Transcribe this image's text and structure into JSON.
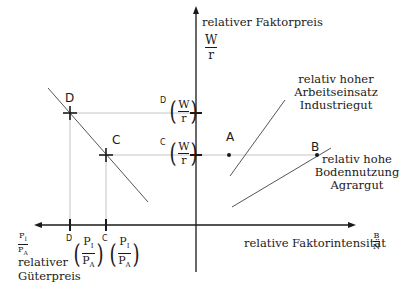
{
  "y_axis": {
    "label": "relativer Faktorpreis",
    "fraction": {
      "num": "W",
      "den": "r"
    }
  },
  "x_axis": {
    "label": "relative Faktorintensität",
    "fraction": {
      "num": "B",
      "den": "N"
    }
  },
  "left_axis": {
    "fraction": {
      "num": "P",
      "num_sub": "I",
      "den": "P",
      "den_sub": "A"
    },
    "label_line1": "relativer",
    "label_line2": "Güterpreis"
  },
  "points": {
    "A": "A",
    "B": "B",
    "C": "C",
    "D": "D"
  },
  "tick_labels": {
    "wr_D": {
      "prefix": "D",
      "num": "W",
      "den": "r"
    },
    "wr_C": {
      "prefix": "C",
      "num": "W",
      "den": "r"
    },
    "p_D": {
      "prefix": "D",
      "num": "P",
      "num_sub": "I",
      "den": "P",
      "den_sub": "A"
    },
    "p_C": {
      "prefix": "C",
      "num": "P",
      "num_sub": "I",
      "den": "P",
      "den_sub": "A"
    }
  },
  "curves": {
    "industrie": {
      "line1": "relativ hoher",
      "line2": "Arbeitseinsatz",
      "line3": "Industriegut"
    },
    "agrar": {
      "line1": "relativ hohe",
      "line2": "Bodennutzung",
      "line3": "Agrargut"
    }
  },
  "colors": {
    "axis": "#1a1a1a",
    "line": "#555555",
    "guide": "#bbbbbb"
  }
}
